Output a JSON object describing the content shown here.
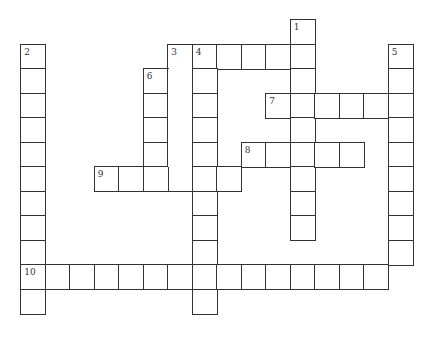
{
  "puzzle": {
    "grid": {
      "origin_x": 21,
      "origin_y": 20,
      "cell_size": 24.5,
      "line_color": "#333333"
    },
    "entries": [
      {
        "number": "1",
        "direction": "down",
        "row": 0,
        "col": 11,
        "length": 9
      },
      {
        "number": "2",
        "direction": "down",
        "row": 1,
        "col": 0,
        "length": 11
      },
      {
        "number": "3",
        "direction": "across",
        "row": 1,
        "col": 6,
        "length": 6
      },
      {
        "number": "3",
        "direction": "down",
        "row": 1,
        "col": 6,
        "length": 6
      },
      {
        "number": "4",
        "direction": "down",
        "row": 1,
        "col": 7,
        "length": 11
      },
      {
        "number": "5",
        "direction": "down",
        "row": 1,
        "col": 15,
        "length": 9
      },
      {
        "number": "6",
        "direction": "down",
        "row": 2,
        "col": 5,
        "length": 5
      },
      {
        "number": "7",
        "direction": "across",
        "row": 3,
        "col": 10,
        "length": 6
      },
      {
        "number": "8",
        "direction": "across",
        "row": 5,
        "col": 9,
        "length": 5
      },
      {
        "number": "9",
        "direction": "across",
        "row": 6,
        "col": 3,
        "length": 6
      },
      {
        "number": "10",
        "direction": "across",
        "row": 10,
        "col": 0,
        "length": 15
      }
    ],
    "numbered_cells": [
      {
        "label": "1",
        "row": 0,
        "col": 11
      },
      {
        "label": "2",
        "row": 1,
        "col": 0
      },
      {
        "label": "3",
        "row": 1,
        "col": 6
      },
      {
        "label": "4",
        "row": 1,
        "col": 7
      },
      {
        "label": "5",
        "row": 1,
        "col": 15
      },
      {
        "label": "6",
        "row": 2,
        "col": 5
      },
      {
        "label": "7",
        "row": 3,
        "col": 10
      },
      {
        "label": "8",
        "row": 5,
        "col": 9
      },
      {
        "label": "9",
        "row": 6,
        "col": 3
      },
      {
        "label": "10",
        "row": 10,
        "col": 0
      }
    ],
    "merged_regions": [
      {
        "col": 6,
        "row_start": 2,
        "row_end": 5
      }
    ]
  }
}
